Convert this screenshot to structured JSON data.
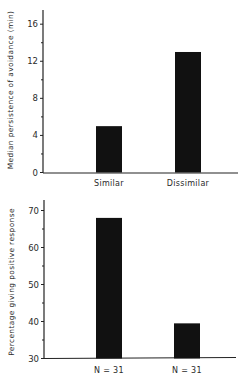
{
  "chart_data": [
    {
      "type": "bar",
      "title": "",
      "xlabel": "",
      "ylabel": "Median persistence of avoidance (min)",
      "categories": [
        "Similar",
        "Dissimilar"
      ],
      "values": [
        5,
        13
      ],
      "ylim": [
        0,
        17
      ],
      "yticks": [
        0,
        4,
        8,
        12,
        16
      ],
      "ytick_labels": [
        "0",
        "4",
        "8",
        "12",
        "16"
      ],
      "grid": false,
      "legend": null,
      "bar_color": "#111111"
    },
    {
      "type": "bar",
      "title": "",
      "xlabel": "",
      "ylabel": "Percentage giving positive response",
      "categories": [
        "N = 31",
        "N = 31"
      ],
      "values": [
        68,
        39.5
      ],
      "ylim": [
        30,
        73
      ],
      "yticks": [
        30,
        40,
        50,
        60,
        70
      ],
      "ytick_labels": [
        "30",
        "40",
        "50",
        "60",
        "70"
      ],
      "grid": false,
      "legend": null,
      "bar_color": "#111111"
    }
  ]
}
